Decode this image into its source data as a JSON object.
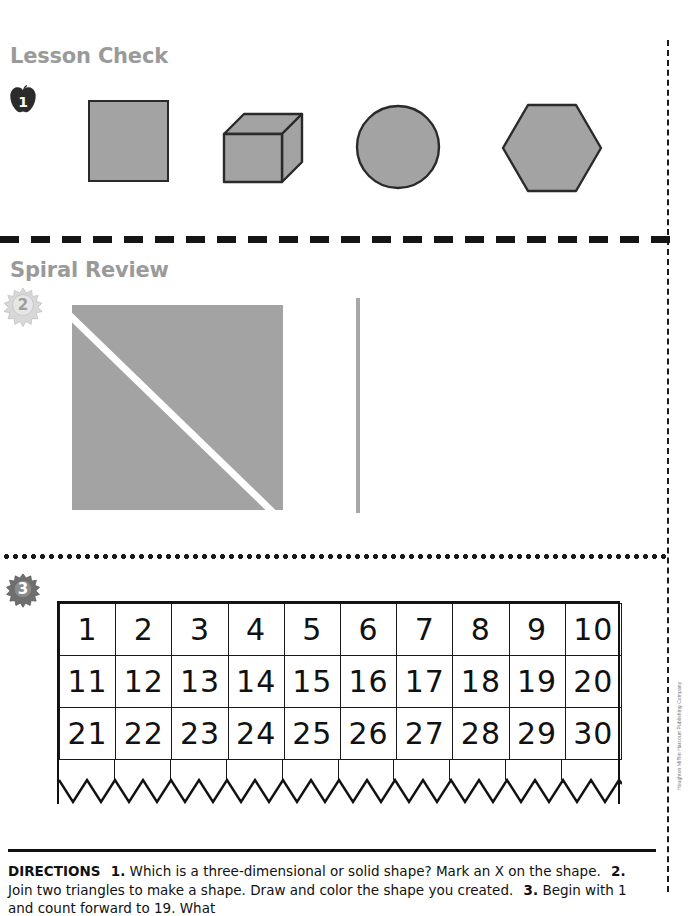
{
  "page": {
    "sections": [
      {
        "id": "lesson-check",
        "title": "Lesson Check"
      },
      {
        "id": "spiral-review",
        "title": "Spiral Review"
      }
    ],
    "badges": {
      "item1": "1",
      "item2": "2",
      "item3": "3"
    },
    "copyright": "Houghton Mifflin Harcourt Publishing Company"
  },
  "colors": {
    "shape_fill": "#a3a3a3",
    "shape_outline": "#2a2a2a",
    "heading_gray": "#9a9a9a",
    "ink": "#111111",
    "paper": "#ffffff"
  },
  "item1": {
    "prompt_number": "1",
    "shapes": [
      {
        "name": "square",
        "kind": "two-dimensional"
      },
      {
        "name": "cube",
        "kind": "three-dimensional"
      },
      {
        "name": "circle",
        "kind": "two-dimensional"
      },
      {
        "name": "hexagon",
        "kind": "two-dimensional"
      }
    ]
  },
  "item2": {
    "prompt_number": "2",
    "figure": "square-split-into-two-triangles",
    "has_vertical_bar": true
  },
  "item3": {
    "prompt_number": "3",
    "chart": {
      "columns": 10,
      "rows": [
        [
          "1",
          "2",
          "3",
          "4",
          "5",
          "6",
          "7",
          "8",
          "9",
          "10"
        ],
        [
          "11",
          "12",
          "13",
          "14",
          "15",
          "16",
          "17",
          "18",
          "19",
          "20"
        ],
        [
          "21",
          "22",
          "23",
          "24",
          "25",
          "26",
          "27",
          "28",
          "29",
          "30"
        ]
      ],
      "torn_bottom_edge": true
    }
  },
  "directions": {
    "label": "DIRECTIONS",
    "items": [
      {
        "number": "1.",
        "text": "Which is a three-dimensional or solid shape? Mark an X on the shape."
      },
      {
        "number": "2.",
        "text": "Join two triangles to make a shape. Draw and color the shape you created."
      },
      {
        "number": "3.",
        "text": "Begin with 1 and count forward to 19. What"
      }
    ]
  }
}
